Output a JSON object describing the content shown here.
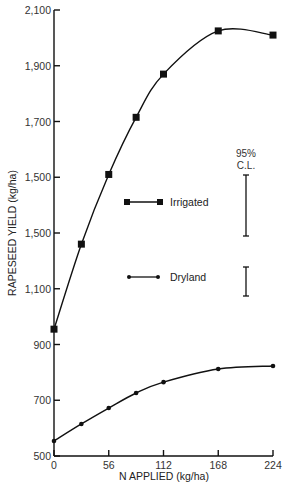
{
  "chart_data": {
    "type": "line",
    "title": "",
    "xlabel": "N APPLIED (kg/ha)",
    "ylabel": "RAPESEED YIELD (kg/ha)",
    "x": [
      0,
      28,
      56,
      84,
      112,
      168,
      224
    ],
    "xticks": [
      0,
      56,
      112,
      168,
      224
    ],
    "xtick_labels": [
      "0",
      "56",
      "112",
      "168",
      "224"
    ],
    "yticks": [
      500,
      700,
      900,
      1100,
      1300,
      1500,
      1700,
      1900,
      2100
    ],
    "ytick_labels": [
      "500",
      "700",
      "900",
      "1,100",
      "1,500",
      "1,500",
      "1,700",
      "1,900",
      "2,100"
    ],
    "xlim": [
      0,
      224
    ],
    "ylim": [
      500,
      2100
    ],
    "grid": false,
    "legend_position": "center",
    "series": [
      {
        "name": "Irrigated",
        "marker": "square",
        "values": [
          955,
          1260,
          1510,
          1715,
          1870,
          2025,
          2010
        ]
      },
      {
        "name": "Dryland",
        "marker": "circle",
        "values": [
          554,
          615,
          672,
          726,
          765,
          812,
          823
        ]
      }
    ],
    "annotations": [
      {
        "text": "95% C.L.",
        "type": "confidence-interval-bars"
      }
    ],
    "confidence_intervals": {
      "label_line1": "95%",
      "label_line2": "C.L.",
      "irrigated_half_width": 110,
      "dryland_half_width": 52
    }
  },
  "colors": {
    "line": "#111111",
    "text": "#333333",
    "background": "#ffffff"
  }
}
